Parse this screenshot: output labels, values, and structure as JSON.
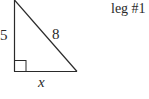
{
  "diagram": {
    "type": "right-triangle",
    "caption": "leg #1",
    "labels": {
      "vertical_leg": "5",
      "hypotenuse": "8",
      "horizontal_leg": "x"
    },
    "colors": {
      "stroke": "#2a2a2a",
      "background": "#ffffff"
    }
  }
}
